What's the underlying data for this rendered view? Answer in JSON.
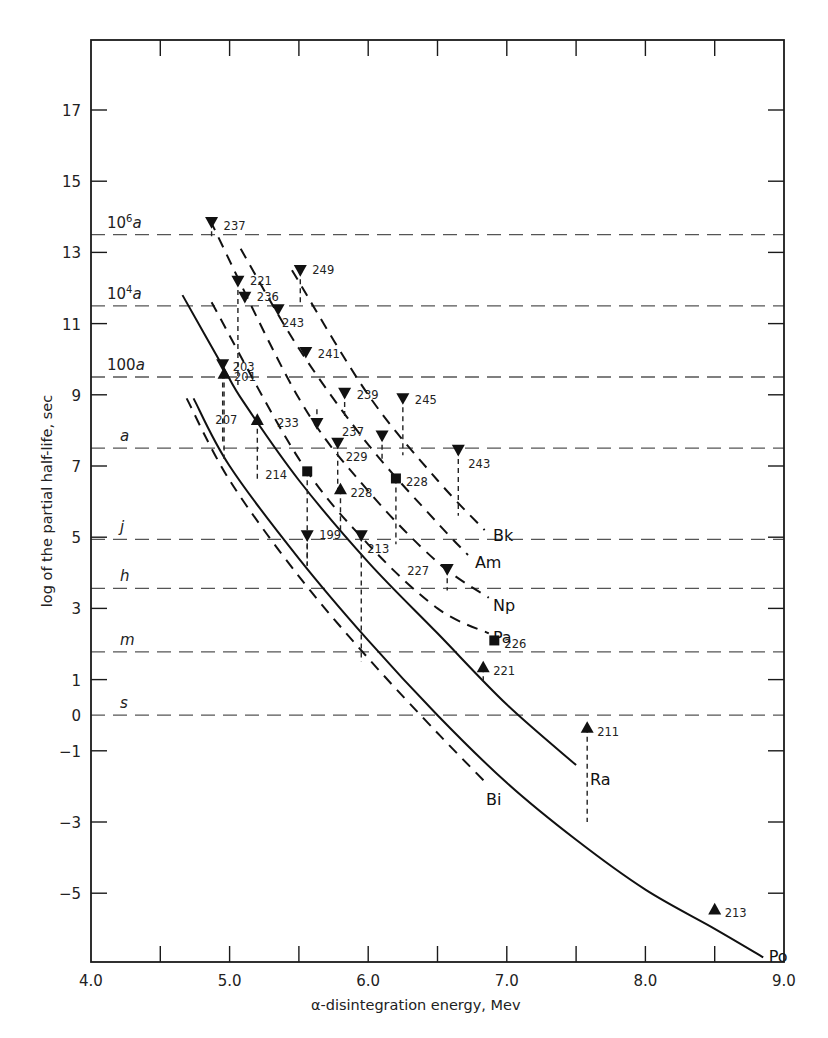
{
  "chart_data": {
    "type": "line",
    "title": "",
    "xlabel": "α-disintegration energy, Mev",
    "ylabel": "log of the partial half-life, sec",
    "xlim": [
      4.0,
      9.0
    ],
    "ylim": [
      -7.0,
      19.0
    ],
    "x_ticks": [
      {
        "value": 4.0,
        "label": "4.0"
      },
      {
        "value": 5.0,
        "label": "5.0"
      },
      {
        "value": 6.0,
        "label": "6.0"
      },
      {
        "value": 7.0,
        "label": "7.0"
      },
      {
        "value": 8.0,
        "label": "8.0"
      },
      {
        "value": 9.0,
        "label": "9.0"
      }
    ],
    "x_minor_ticks": [
      4.5,
      5.5,
      6.5,
      7.5,
      8.5
    ],
    "y_ticks": [
      {
        "value": 17,
        "label": "17"
      },
      {
        "value": 15,
        "label": "15"
      },
      {
        "value": 13,
        "label": "13"
      },
      {
        "value": 11,
        "label": "11"
      },
      {
        "value": 9,
        "label": "9"
      },
      {
        "value": 7,
        "label": "7"
      },
      {
        "value": 5,
        "label": "5"
      },
      {
        "value": 3,
        "label": "3"
      },
      {
        "value": 1,
        "label": "1"
      },
      {
        "value": 0,
        "label": "0"
      },
      {
        "value": -1,
        "label": "−1"
      },
      {
        "value": -3,
        "label": "−3"
      },
      {
        "value": -5,
        "label": "−5"
      }
    ],
    "reference_lines": [
      {
        "value": 13.5,
        "label": "10",
        "sup": "6",
        "unit": "a"
      },
      {
        "value": 11.5,
        "label": "10",
        "sup": "4",
        "unit": "a"
      },
      {
        "value": 9.5,
        "label": "100",
        "sup": "",
        "unit": "a"
      },
      {
        "value": 7.5,
        "label": "",
        "sup": "",
        "unit": "a"
      },
      {
        "value": 4.94,
        "label": "",
        "sup": "",
        "unit": "j"
      },
      {
        "value": 3.56,
        "label": "",
        "sup": "",
        "unit": "h"
      },
      {
        "value": 1.78,
        "label": "",
        "sup": "",
        "unit": "m"
      },
      {
        "value": 0.0,
        "label": "",
        "sup": "",
        "unit": "s"
      }
    ],
    "series": [
      {
        "name": "Po",
        "style": "solid",
        "points": [
          [
            4.74,
            8.9
          ],
          [
            5.0,
            7.0
          ],
          [
            5.5,
            4.4
          ],
          [
            6.0,
            2.1
          ],
          [
            6.5,
            0.0
          ],
          [
            7.0,
            -1.9
          ],
          [
            7.5,
            -3.5
          ],
          [
            8.0,
            -4.9
          ],
          [
            8.5,
            -6.0
          ],
          [
            8.85,
            -6.8
          ]
        ],
        "label_at": [
          8.89,
          -6.75
        ]
      },
      {
        "name": "Bi",
        "style": "dashed",
        "points": [
          [
            4.69,
            8.9
          ],
          [
            5.0,
            6.6
          ],
          [
            5.5,
            3.9
          ],
          [
            6.0,
            1.6
          ],
          [
            6.5,
            -0.5
          ],
          [
            6.85,
            -1.9
          ]
        ],
        "label_at": [
          6.85,
          -2.35
        ]
      },
      {
        "name": "Ra",
        "style": "solid",
        "points": [
          [
            4.66,
            11.8
          ],
          [
            4.95,
            9.8
          ],
          [
            5.1,
            8.8
          ],
          [
            5.5,
            6.6
          ],
          [
            6.0,
            4.3
          ],
          [
            6.5,
            2.3
          ],
          [
            7.0,
            0.3
          ],
          [
            7.5,
            -1.4
          ]
        ],
        "label_at": [
          7.6,
          -1.8
        ]
      },
      {
        "name": "Pa",
        "style": "dashed",
        "points": [
          [
            4.87,
            11.6
          ],
          [
            5.5,
            7.2
          ],
          [
            6.0,
            4.8
          ],
          [
            6.5,
            3.0
          ],
          [
            6.87,
            2.3
          ]
        ],
        "label_at": [
          6.9,
          2.2
        ]
      },
      {
        "name": "Np",
        "style": "dashed",
        "points": [
          [
            4.86,
            13.9
          ],
          [
            5.5,
            8.9
          ],
          [
            6.0,
            6.3
          ],
          [
            6.5,
            4.3
          ],
          [
            6.87,
            3.3
          ]
        ],
        "label_at": [
          6.9,
          3.1
        ]
      },
      {
        "name": "Am",
        "style": "dashed",
        "points": [
          [
            5.08,
            13.1
          ],
          [
            5.5,
            10.3
          ],
          [
            6.0,
            7.6
          ],
          [
            6.5,
            5.4
          ],
          [
            6.72,
            4.5
          ]
        ],
        "label_at": [
          6.77,
          4.3
        ]
      },
      {
        "name": "Bk",
        "style": "dashed",
        "points": [
          [
            5.45,
            12.5
          ],
          [
            6.0,
            9.0
          ],
          [
            6.5,
            6.6
          ],
          [
            6.84,
            5.2
          ]
        ],
        "label_at": [
          6.9,
          5.05
        ]
      }
    ],
    "points": [
      {
        "mass": "237",
        "marker": "down",
        "x": 4.87,
        "y": 13.85,
        "drop_to": 13.4,
        "label_dx": 12,
        "label_dy": 4
      },
      {
        "mass": "221",
        "marker": "down",
        "x": 5.06,
        "y": 12.2,
        "drop_to": 9.2,
        "label_dx": 12,
        "label_dy": 0
      },
      {
        "mass": "236",
        "marker": "down",
        "x": 5.11,
        "y": 11.75,
        "drop_to": 11.5,
        "label_dx": 12,
        "label_dy": 0
      },
      {
        "mass": "249",
        "marker": "down",
        "x": 5.51,
        "y": 12.5,
        "drop_to": 11.5,
        "label_dx": 12,
        "label_dy": 0
      },
      {
        "mass": "243",
        "marker": "down",
        "x": 5.35,
        "y": 11.4,
        "drop_to": 11.4,
        "label_dx": 4,
        "label_dy": 14
      },
      {
        "mass": "241",
        "marker": "down",
        "x": 5.55,
        "y": 10.2,
        "drop_to": 10.2,
        "label_dx": 12,
        "label_dy": 2
      },
      {
        "mass": "203",
        "marker": "down",
        "x": 4.95,
        "y": 9.85,
        "drop_to": 7.6,
        "label_dx": 10,
        "label_dy": 2
      },
      {
        "mass": "201",
        "marker": "up",
        "x": 4.96,
        "y": 9.6,
        "drop_to": 7.2,
        "label_dx": 10,
        "label_dy": 4
      },
      {
        "mass": "239",
        "marker": "down",
        "x": 5.83,
        "y": 9.05,
        "drop_to": 8.4,
        "label_dx": 12,
        "label_dy": 2
      },
      {
        "mass": "245",
        "marker": "down",
        "x": 6.25,
        "y": 8.9,
        "drop_to": 7.3,
        "label_dx": 12,
        "label_dy": 2
      },
      {
        "mass": "207",
        "marker": "up",
        "x": 5.2,
        "y": 8.3,
        "drop_to": 6.6,
        "label_dx": -42,
        "label_dy": 0
      },
      {
        "mass": "233",
        "marker": "down",
        "x": 5.63,
        "y": 8.2,
        "drop_to": 8.6,
        "label_dx": -40,
        "label_dy": 0
      },
      {
        "mass": "237",
        "marker": "down",
        "x": 6.1,
        "y": 7.85,
        "drop_to": 7.1,
        "label_dx": -40,
        "label_dy": -4
      },
      {
        "mass": "229",
        "marker": "down",
        "x": 5.78,
        "y": 7.65,
        "drop_to": 6.3,
        "label_dx": 8,
        "label_dy": 14
      },
      {
        "mass": "243",
        "marker": "down",
        "x": 6.65,
        "y": 7.45,
        "drop_to": 5.6,
        "label_dx": 10,
        "label_dy": 14
      },
      {
        "mass": "214",
        "marker": "square",
        "x": 5.56,
        "y": 6.85,
        "drop_to": 4.2,
        "label_dx": -42,
        "label_dy": 4
      },
      {
        "mass": "228",
        "marker": "square",
        "x": 6.2,
        "y": 6.65,
        "drop_to": 4.8,
        "label_dx": 10,
        "label_dy": 4
      },
      {
        "mass": "228",
        "marker": "up",
        "x": 5.8,
        "y": 6.35,
        "drop_to": 5.2,
        "label_dx": 10,
        "label_dy": 4
      },
      {
        "mass": "199",
        "marker": "down",
        "x": 5.56,
        "y": 5.05,
        "drop_to": 4.2,
        "label_dx": 12,
        "label_dy": 0
      },
      {
        "mass": "213",
        "marker": "down",
        "x": 5.95,
        "y": 5.05,
        "drop_to": 1.5,
        "label_dx": 6,
        "label_dy": 14
      },
      {
        "mass": "227",
        "marker": "down",
        "x": 6.57,
        "y": 4.1,
        "drop_to": 3.5,
        "label_dx": -40,
        "label_dy": 2
      },
      {
        "mass": "226",
        "marker": "square",
        "x": 6.91,
        "y": 2.1,
        "drop_to": null,
        "label_dx": 10,
        "label_dy": 4
      },
      {
        "mass": "221",
        "marker": "up",
        "x": 6.83,
        "y": 1.35,
        "drop_to": 0.9,
        "label_dx": 10,
        "label_dy": 4
      },
      {
        "mass": "211",
        "marker": "up",
        "x": 7.58,
        "y": -0.35,
        "drop_to": -3.0,
        "label_dx": 10,
        "label_dy": 4
      },
      {
        "mass": "213",
        "marker": "up",
        "x": 8.5,
        "y": -5.45,
        "drop_to": null,
        "label_dx": 10,
        "label_dy": 4
      }
    ],
    "grid": false,
    "legend": "curve labels placed inline at line ends"
  },
  "colors": {
    "ink": "#111111",
    "axis": "#1a1a1a",
    "reference": "#555555",
    "background": "#ffffff"
  }
}
